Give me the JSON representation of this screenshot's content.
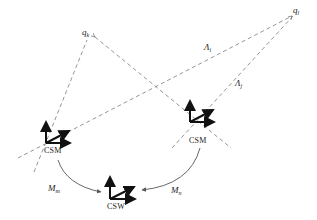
{
  "diagram": {
    "points": [
      {
        "id": "qk",
        "base": "q",
        "sub": "k"
      },
      {
        "id": "ql",
        "base": "q",
        "sub": "l"
      }
    ],
    "rays": [
      {
        "id": "lambda_i",
        "base": "Λ",
        "sub": "i"
      },
      {
        "id": "lambda_j",
        "base": "Λ",
        "sub": "j"
      }
    ],
    "frames": [
      {
        "id": "csm_left",
        "label": "CSM"
      },
      {
        "id": "csm_right",
        "label": "CSM"
      },
      {
        "id": "csw",
        "label": "CSW"
      }
    ],
    "transforms": [
      {
        "id": "m_m",
        "base": "M",
        "sub": "m"
      },
      {
        "id": "m_n",
        "base": "M",
        "sub": "n"
      }
    ],
    "colors": {
      "dashed": "#8a8a8a",
      "arrow": "#111111",
      "curve": "#555555",
      "text": "#222222"
    }
  }
}
